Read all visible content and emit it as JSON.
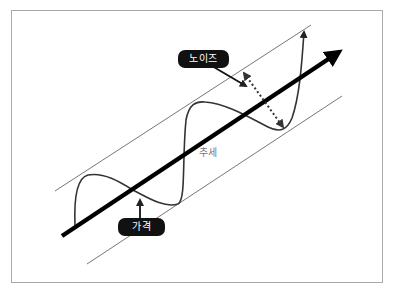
{
  "diagram": {
    "title": "",
    "labels": {
      "noise": "노이즈",
      "price": "가격",
      "trend": "추세"
    },
    "elements": {
      "trend_line": "thick black arrow rising from lower-left to upper-right",
      "channel_lines": "two thin parallel lines bounding the price wave",
      "price_wave": "oscillating curve around the trend ending in an upward arrow",
      "noise_span": "dotted double-headed arrow spanning the channel width"
    },
    "colors": {
      "trend": "#000000",
      "wave": "#333333",
      "channel": "#777777",
      "label_bg": "#111111",
      "label_text": "#ffffff",
      "trend_text": "#777777",
      "frame": "#a9a9a9"
    }
  }
}
